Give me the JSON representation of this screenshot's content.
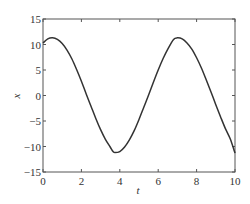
{
  "chart_data": {
    "type": "line",
    "title": "",
    "xlabel": "t",
    "ylabel": "x",
    "xlim": [
      0,
      10
    ],
    "ylim": [
      -15,
      15
    ],
    "xticks": [
      0,
      2,
      4,
      6,
      8,
      10
    ],
    "yticks": [
      15,
      10,
      5,
      0,
      -5,
      -10,
      -15
    ],
    "xtick_labels": [
      "0",
      "2",
      "4",
      "6",
      "8",
      "10"
    ],
    "ytick_labels": [
      "15",
      "10",
      "5",
      "0",
      "−5",
      "−10",
      "−15"
    ],
    "grid": false,
    "legend": null,
    "series": [
      {
        "name": "x(t)",
        "color": "#333333",
        "x": [
          0,
          0.25,
          0.5,
          0.75,
          1,
          1.25,
          1.5,
          1.75,
          2,
          2.25,
          2.5,
          2.75,
          3,
          3.25,
          3.5,
          3.65,
          3.75,
          4,
          4.25,
          4.5,
          4.75,
          5,
          5.25,
          5.5,
          5.75,
          6,
          6.25,
          6.5,
          6.8,
          7,
          7.25,
          7.5,
          7.75,
          8,
          8.25,
          8.5,
          8.75,
          9,
          9.25,
          9.5,
          9.75,
          10
        ],
        "y": [
          10.3,
          11.1,
          11.3,
          11.0,
          10.2,
          8.9,
          7.2,
          5.1,
          2.8,
          0.3,
          -2.1,
          -4.5,
          -6.7,
          -8.6,
          -10.1,
          -11.0,
          -11.2,
          -11.0,
          -10.1,
          -8.7,
          -6.9,
          -4.7,
          -2.3,
          0.1,
          2.6,
          5.0,
          7.2,
          9.1,
          11.0,
          11.3,
          11.1,
          10.3,
          9.1,
          7.4,
          5.4,
          3.1,
          0.7,
          -1.8,
          -4.2,
          -6.5,
          -8.5,
          -11.3
        ]
      }
    ]
  }
}
